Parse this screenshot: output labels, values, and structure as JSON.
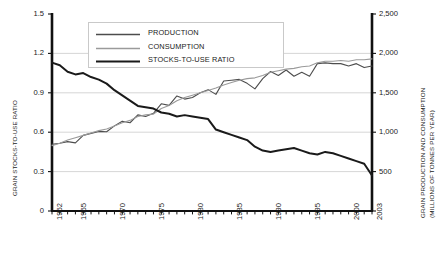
{
  "chart_data": {
    "type": "line",
    "title": "",
    "xlabel": "",
    "ylabel": "GRAIN STOCKS-TO-USE RATIO",
    "ylabel_right_line1": "GRAIN PRODUCTION AND CONSUMPTION",
    "ylabel_right_line2": "(MILLIONS OF TONNES PER YEAR)",
    "grid": true,
    "legend_position": "top-center",
    "xlim": [
      1962,
      2003
    ],
    "ylim": [
      0,
      1.5
    ],
    "ylim_right": [
      0,
      2500
    ],
    "xticks": [
      1962,
      1965,
      1970,
      1975,
      1980,
      1985,
      1990,
      1995,
      2000,
      2003
    ],
    "xticklabels": [
      "1962",
      "1965",
      "1970",
      "1975",
      "1980",
      "1985",
      "1990",
      "1995",
      "2000",
      "2003"
    ],
    "xtick_minor_every": 1,
    "yticks": [
      0,
      0.3,
      0.6,
      0.9,
      1.2,
      1.5
    ],
    "yticklabels": [
      "0",
      "0.3",
      "0.6",
      "0.9",
      "1.2",
      "1.5"
    ],
    "yticks_right": [
      0,
      500,
      1000,
      1500,
      2000,
      2500
    ],
    "yticklabels_right": [
      "",
      "500",
      "1,000",
      "1,500",
      "2,000",
      "2,500"
    ],
    "x": [
      1962,
      1963,
      1964,
      1965,
      1966,
      1967,
      1968,
      1969,
      1970,
      1971,
      1972,
      1973,
      1974,
      1975,
      1976,
      1977,
      1978,
      1979,
      1980,
      1981,
      1982,
      1983,
      1984,
      1985,
      1986,
      1987,
      1988,
      1989,
      1990,
      1991,
      1992,
      1993,
      1994,
      1995,
      1996,
      1997,
      1998,
      1999,
      2000,
      2001,
      2002,
      2003
    ],
    "series": [
      {
        "name": "PRODUCTION",
        "axis": "right",
        "color": "#4d4d4d",
        "width": 1.1,
        "values": [
          845,
          860,
          880,
          865,
          960,
          985,
          1010,
          1005,
          1080,
          1140,
          1120,
          1220,
          1200,
          1240,
          1360,
          1340,
          1460,
          1420,
          1440,
          1500,
          1540,
          1480,
          1650,
          1660,
          1670,
          1620,
          1550,
          1680,
          1770,
          1720,
          1790,
          1710,
          1760,
          1710,
          1870,
          1880,
          1870,
          1870,
          1840,
          1870,
          1820,
          1840
        ]
      },
      {
        "name": "CONSUMPTION",
        "axis": "right",
        "color": "#9a9a9a",
        "width": 1.1,
        "values": [
          830,
          860,
          900,
          930,
          960,
          990,
          1020,
          1040,
          1080,
          1120,
          1150,
          1200,
          1220,
          1230,
          1300,
          1340,
          1400,
          1440,
          1470,
          1500,
          1530,
          1560,
          1600,
          1630,
          1660,
          1680,
          1690,
          1720,
          1760,
          1780,
          1800,
          1810,
          1830,
          1840,
          1880,
          1900,
          1900,
          1910,
          1900,
          1920,
          1920,
          1930
        ]
      },
      {
        "name": "STOCKS-TO-USE RATIO",
        "axis": "left",
        "color": "#1a1a1a",
        "width": 2.0,
        "values": [
          1.13,
          1.11,
          1.06,
          1.04,
          1.05,
          1.02,
          1.0,
          0.97,
          0.92,
          0.88,
          0.84,
          0.8,
          0.79,
          0.78,
          0.75,
          0.74,
          0.72,
          0.73,
          0.72,
          0.71,
          0.7,
          0.62,
          0.6,
          0.58,
          0.56,
          0.54,
          0.49,
          0.46,
          0.45,
          0.46,
          0.47,
          0.48,
          0.46,
          0.44,
          0.43,
          0.45,
          0.44,
          0.42,
          0.4,
          0.38,
          0.36,
          0.27
        ]
      }
    ],
    "legend": [
      {
        "label": "PRODUCTION",
        "color": "#4d4d4d",
        "width": 1.3
      },
      {
        "label": "CONSUMPTION",
        "color": "#9a9a9a",
        "width": 1.3
      },
      {
        "label": "STOCKS-TO-USE RATIO",
        "color": "#1a1a1a",
        "width": 2.2
      }
    ],
    "plot_box": {
      "left": 52,
      "right": 372,
      "top": 14,
      "bottom": 211
    }
  }
}
